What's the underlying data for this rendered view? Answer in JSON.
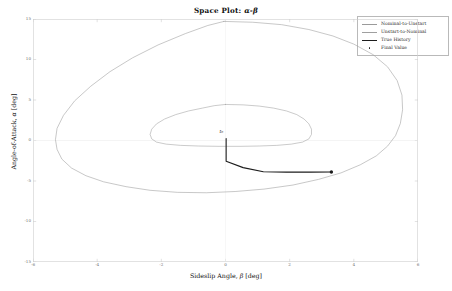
{
  "chart_data": {
    "type": "line",
    "title": "Space Plot: α-β",
    "title_prefix": "Space Plot: ",
    "title_math": "α-β",
    "xlabel_text": "Sideslip Angle, ",
    "xlabel_sym": "β",
    "xlabel_unit": " [deg]",
    "xlabel": "Sideslip Angle, β [deg]",
    "ylabel_text": "Angle-of-Attack, ",
    "ylabel_sym": "α",
    "ylabel_unit": " [deg]",
    "ylabel": "Angle-of-Attack, α [deg]",
    "xlim": [
      -6,
      6
    ],
    "ylim": [
      -15,
      15
    ],
    "xticks": [
      -6,
      -4,
      -2,
      0,
      2,
      4,
      6
    ],
    "xtick_labels": [
      "-6",
      "-4",
      "-2",
      "0",
      "2",
      "4",
      "6"
    ],
    "yticks": [
      -15,
      -10,
      -5,
      0,
      5,
      10,
      15
    ],
    "ytick_labels": [
      "-15",
      "-10",
      "-5",
      "0",
      "5",
      "10",
      "15"
    ],
    "grid": false,
    "legend_position": "upper right",
    "series": [
      {
        "name": "Nominal-to-Unstart",
        "kind": "closed-contour",
        "color": "#9a9a9a",
        "linewidth": 0.55,
        "points": [
          [
            -0.05,
            14.7
          ],
          [
            0.85,
            14.6
          ],
          [
            1.75,
            14.3
          ],
          [
            2.6,
            13.7
          ],
          [
            3.35,
            12.9
          ],
          [
            4.0,
            11.9
          ],
          [
            4.6,
            10.6
          ],
          [
            5.05,
            9.1
          ],
          [
            5.35,
            7.4
          ],
          [
            5.5,
            5.6
          ],
          [
            5.52,
            3.8
          ],
          [
            5.45,
            2.1
          ],
          [
            5.3,
            0.6
          ],
          [
            5.05,
            -0.7
          ],
          [
            4.7,
            -1.9
          ],
          [
            4.2,
            -3.0
          ],
          [
            3.6,
            -4.0
          ],
          [
            2.9,
            -4.8
          ],
          [
            2.1,
            -5.5
          ],
          [
            1.2,
            -6.0
          ],
          [
            0.3,
            -6.3
          ],
          [
            -0.6,
            -6.45
          ],
          [
            -1.5,
            -6.4
          ],
          [
            -2.35,
            -6.15
          ],
          [
            -3.1,
            -5.7
          ],
          [
            -3.8,
            -5.1
          ],
          [
            -4.35,
            -4.35
          ],
          [
            -4.8,
            -3.4
          ],
          [
            -5.1,
            -2.3
          ],
          [
            -5.25,
            -1.1
          ],
          [
            -5.3,
            0.1
          ],
          [
            -5.25,
            1.5
          ],
          [
            -5.05,
            3.1
          ],
          [
            -4.7,
            4.9
          ],
          [
            -4.2,
            6.7
          ],
          [
            -3.6,
            8.5
          ],
          [
            -2.9,
            10.2
          ],
          [
            -2.1,
            11.8
          ],
          [
            -1.25,
            13.2
          ],
          [
            -0.55,
            14.2
          ],
          [
            -0.05,
            14.7
          ]
        ]
      },
      {
        "name": "Unstart-to-Nominal",
        "kind": "closed-contour",
        "color": "#9f9f9f",
        "linewidth": 0.55,
        "points": [
          [
            0.0,
            4.45
          ],
          [
            0.55,
            4.4
          ],
          [
            1.05,
            4.25
          ],
          [
            1.5,
            4.0
          ],
          [
            1.9,
            3.65
          ],
          [
            2.22,
            3.2
          ],
          [
            2.45,
            2.65
          ],
          [
            2.6,
            2.05
          ],
          [
            2.68,
            1.4
          ],
          [
            2.68,
            0.75
          ],
          [
            2.6,
            0.2
          ],
          [
            2.4,
            -0.2
          ],
          [
            2.05,
            -0.45
          ],
          [
            1.6,
            -0.6
          ],
          [
            1.05,
            -0.68
          ],
          [
            0.45,
            -0.72
          ],
          [
            -0.2,
            -0.72
          ],
          [
            -0.85,
            -0.68
          ],
          [
            -1.4,
            -0.6
          ],
          [
            -1.85,
            -0.45
          ],
          [
            -2.15,
            -0.2
          ],
          [
            -2.3,
            0.2
          ],
          [
            -2.35,
            0.75
          ],
          [
            -2.3,
            1.4
          ],
          [
            -2.15,
            2.05
          ],
          [
            -1.9,
            2.65
          ],
          [
            -1.55,
            3.2
          ],
          [
            -1.15,
            3.65
          ],
          [
            -0.72,
            4.0
          ],
          [
            -0.35,
            4.3
          ],
          [
            0.0,
            4.45
          ]
        ]
      },
      {
        "name": "True History",
        "kind": "trajectory",
        "color": "#1c1c1c",
        "linewidth": 1.1,
        "points": [
          [
            0.02,
            0.25
          ],
          [
            0.02,
            -1.6
          ],
          [
            0.02,
            -2.55
          ],
          [
            0.55,
            -3.35
          ],
          [
            1.18,
            -3.85
          ],
          [
            1.9,
            -3.9
          ],
          [
            2.65,
            -3.9
          ],
          [
            3.3,
            -3.88
          ]
        ]
      },
      {
        "name": "Final Value",
        "kind": "marker",
        "color": "#1c1c1c",
        "markersize": 1.7,
        "points": [
          [
            3.3,
            -3.88
          ]
        ]
      }
    ],
    "annotations": [
      {
        "text": "t₀",
        "x": 0.02,
        "y": 0.4,
        "dx": -3,
        "dy": -4
      }
    ]
  },
  "legend": {
    "entries": [
      {
        "label": "Nominal-to-Unstart",
        "key": "line",
        "color": "#9a9a9a"
      },
      {
        "label": "Unstart-to-Nominal",
        "key": "line",
        "color": "#9f9f9f"
      },
      {
        "label": "True History",
        "key": "line",
        "color": "#1c1c1c"
      },
      {
        "label": "Final Value",
        "key": "dot",
        "color": "#1c1c1c"
      }
    ]
  },
  "colors": {
    "axis": "#cfcfcf",
    "tick_text": "#6f6f6f",
    "label_text": "#111111",
    "background": "#ffffff",
    "legend_border": "#b9b9b9"
  }
}
